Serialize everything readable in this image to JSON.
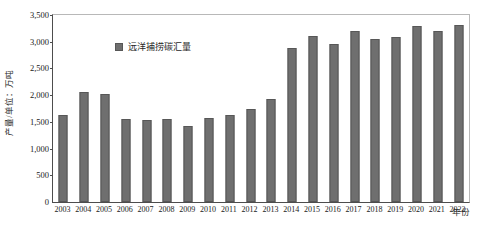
{
  "chart_data": {
    "type": "bar",
    "title": "",
    "xlabel": "年份",
    "ylabel": "产量/单位：万吨",
    "ylim": [
      0,
      3500
    ],
    "ytick_labels": [
      "0",
      "500",
      "1,000",
      "1,500",
      "2,000",
      "2,500",
      "3,000",
      "3,500"
    ],
    "ytick_values": [
      0,
      500,
      1000,
      1500,
      2000,
      2500,
      3000,
      3500
    ],
    "grid": false,
    "legend_position": "top-left",
    "legend": [
      "远洋捕捞碳汇量"
    ],
    "series_color": "#6f6f6f",
    "categories": [
      "2003",
      "2004",
      "2005",
      "2006",
      "2007",
      "2008",
      "2009",
      "2010",
      "2011",
      "2012",
      "2013",
      "2014",
      "2015",
      "2016",
      "2017",
      "2018",
      "2019",
      "2020",
      "2021",
      "2022"
    ],
    "series": [
      {
        "name": "远洋捕捞碳汇量",
        "values": [
          1630,
          2050,
          2030,
          1550,
          1540,
          1545,
          1420,
          1580,
          1620,
          1740,
          1930,
          2880,
          3110,
          2960,
          3200,
          3060,
          3090,
          3290,
          3200,
          3310
        ]
      }
    ]
  },
  "legend": {
    "label": "远洋捕捞碳汇量",
    "swatch_color": "#6f6f6f"
  },
  "axes": {
    "y_title": "产量/单位：万吨",
    "x_title": "年份"
  }
}
